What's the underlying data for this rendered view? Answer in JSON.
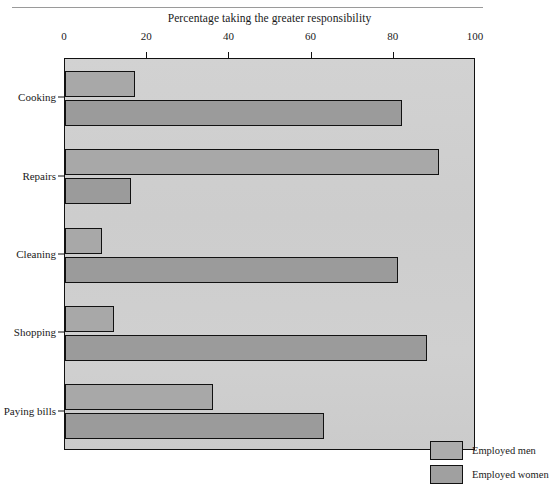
{
  "chart_data": {
    "type": "bar",
    "orientation": "horizontal",
    "title": "Percentage taking the greater responsibility",
    "xlabel": "",
    "ylabel": "",
    "xlim": [
      0,
      100
    ],
    "xticks": [
      0,
      20,
      40,
      60,
      80,
      100
    ],
    "xtick_labels": [
      "0",
      "20",
      "40",
      "60",
      "80",
      "100"
    ],
    "grid": false,
    "legend_position": "bottom-right",
    "categories": [
      "Cooking",
      "Repairs",
      "Cleaning",
      "Shopping",
      "Paying bills"
    ],
    "series": [
      {
        "name": "Employed men",
        "color": "#a8a8a8",
        "values": [
          17,
          91,
          9,
          12,
          36
        ]
      },
      {
        "name": "Employed women",
        "color": "#9b9b9b",
        "values": [
          82,
          16,
          81,
          88,
          63
        ]
      }
    ]
  },
  "legend": {
    "entries": [
      {
        "label": "Employed men"
      },
      {
        "label": "Employed women"
      }
    ]
  },
  "colors": {
    "plot_background": "#cfcfcf",
    "men_bar": "#a8a8a8",
    "women_bar": "#9b9b9b",
    "axis": "#111111",
    "page_background": "#ffffff"
  }
}
